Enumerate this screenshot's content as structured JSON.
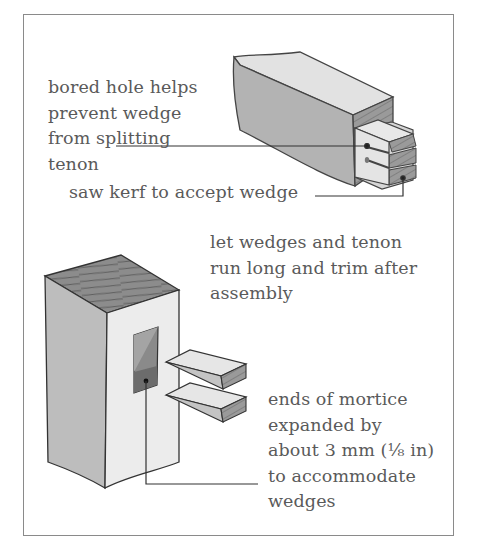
{
  "diagram": {
    "annotations": [
      {
        "id": "bored-hole",
        "lines": [
          "bored hole helps",
          "prevent wedge",
          "from splitting",
          "tenon"
        ]
      },
      {
        "id": "saw-kerf",
        "lines": [
          "saw kerf to accept wedge"
        ]
      },
      {
        "id": "trim-after",
        "lines": [
          "let wedges and tenon",
          "run long and trim after",
          "assembly"
        ]
      },
      {
        "id": "mortice-ends",
        "lines": [
          "ends of mortice",
          "expanded by",
          "about 3 mm (⅛ in)",
          "to accommodate",
          "wedges"
        ]
      }
    ],
    "parts": [
      "tenon with saw kerfs and bored holes",
      "mortice post",
      "two wedges"
    ],
    "colors": {
      "text": "#5a5a5a",
      "frame": "#8a8a8a",
      "leader": "#333333",
      "wood_light": "#e6e6e6",
      "wood_mid": "#bdbdbd",
      "wood_dark": "#8f8f8f"
    }
  }
}
